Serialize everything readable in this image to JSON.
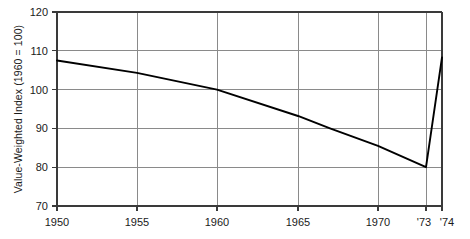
{
  "chart_data": {
    "type": "line",
    "title": "",
    "xlabel": "",
    "ylabel": "Value-Weighted Index (1960 = 100)",
    "ylim": [
      70,
      120
    ],
    "xlim": [
      1950,
      1974
    ],
    "grid": true,
    "legend": "none",
    "yticks": [
      70,
      80,
      90,
      100,
      110,
      120
    ],
    "ytick_labels": [
      "70",
      "80",
      "90",
      "100",
      "110",
      "120"
    ],
    "xticks": [
      1950,
      1955,
      1960,
      1965,
      1970,
      1973,
      1974
    ],
    "xtick_labels": [
      "1950",
      "1955",
      "1960",
      "1965",
      "1970",
      "'73",
      "'74"
    ],
    "series": [
      {
        "name": "Value-Weighted Index",
        "color": "#000000",
        "x": [
          1950,
          1955,
          1960,
          1965,
          1967,
          1970,
          1973,
          1974
        ],
        "values": [
          107.5,
          104.3,
          100.0,
          93.2,
          90.0,
          85.5,
          80.0,
          108.3
        ]
      }
    ]
  },
  "style": {
    "axis_color": "#3a3a3a",
    "grid_color": "#8a8a8a",
    "line_color": "#000000",
    "background": "#ffffff"
  }
}
